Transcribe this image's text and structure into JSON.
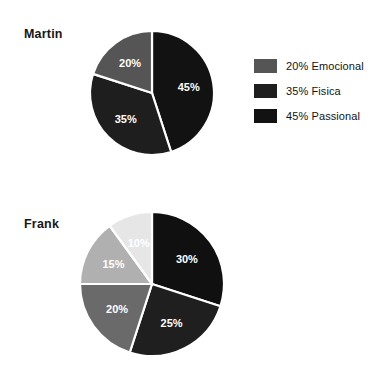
{
  "page": {
    "background_color": "#ffffff",
    "text_color": "#141414"
  },
  "chart_data": [
    {
      "type": "pie",
      "title": "Martin",
      "start_angle_deg": 0,
      "direction": "clockwise",
      "center": [
        152,
        93
      ],
      "radius": 62,
      "separator_color": "#ffffff",
      "labels": [
        "45% Passional",
        "35% Fisica",
        "20% Emocional"
      ],
      "categories": [
        "Passional",
        "Fisica",
        "Emocional"
      ],
      "values": [
        45,
        35,
        20
      ],
      "value_labels": [
        "45%",
        "35%",
        "20%"
      ],
      "colors": [
        "#121212",
        "#1e1e1e",
        "#555555"
      ],
      "legend": {
        "position": "right",
        "entries": [
          {
            "label": "20% Emocional",
            "value": 20,
            "category": "Emocional",
            "color": "#555555"
          },
          {
            "label": "35% Fisica",
            "value": 35,
            "category": "Fisica",
            "color": "#1e1e1e"
          },
          {
            "label": "45% Passional",
            "value": 45,
            "category": "Passional",
            "color": "#121212"
          }
        ]
      }
    },
    {
      "type": "pie",
      "title": "Frank",
      "start_angle_deg": 0,
      "direction": "clockwise",
      "center": [
        152,
        284
      ],
      "radius": 72,
      "separator_color": "#ffffff",
      "labels": [
        "30% Emocional",
        "25% Espiritual",
        "20% Fisica",
        "15% Recreativa",
        "10% Intelectual"
      ],
      "categories": [
        "Emocional",
        "Espiritual",
        "Fisica",
        "Recreativa",
        "Intelectual"
      ],
      "values": [
        30,
        25,
        20,
        15,
        10
      ],
      "value_labels": [
        "30%",
        "25%",
        "20%",
        "15%",
        "10%"
      ],
      "colors": [
        "#101010",
        "#1f1f1f",
        "#6a6a6a",
        "#b0b0b0",
        "#e6e6e6"
      ],
      "legend": {
        "position": "right",
        "entries": [
          {
            "label": "10% Intelectual",
            "value": 10,
            "category": "Intelectual",
            "color": "#e6e6e6"
          },
          {
            "label": "15% Recreativa",
            "value": 15,
            "category": "Recreativa",
            "color": "#b0b0b0"
          },
          {
            "label": "20% Fisica",
            "value": 20,
            "category": "Fisica",
            "color": "#6a6a6a"
          },
          {
            "label": "25% Espiritual",
            "value": 25,
            "category": "Espiritual",
            "color": "#1f1f1f"
          },
          {
            "label": "30% Emocional",
            "value": 30,
            "category": "Emocional",
            "color": "#101010"
          }
        ]
      }
    }
  ]
}
